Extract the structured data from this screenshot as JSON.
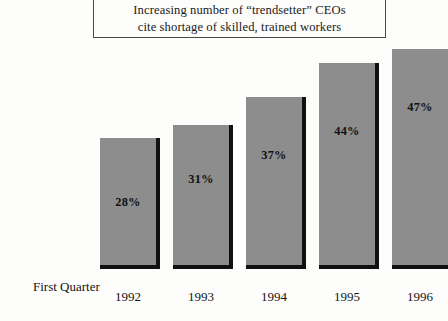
{
  "figure": {
    "background_color": "#fdfdfb",
    "width": 434,
    "height": 321
  },
  "title": {
    "line1": "Increasing number of “trendsetter” CEOs",
    "line2": "cite shortage of skilled, trained workers",
    "border_color": "#4a4a4a"
  },
  "axis_title": {
    "label": "First Quarter"
  },
  "style": {
    "bar_color": "#8d8d8d",
    "bar_shadow_color": "#111111",
    "label_color": "#111111"
  },
  "chart_data": {
    "type": "bar",
    "title": "Increasing number of “trendsetter” CEOs cite shortage of skilled, trained workers",
    "xlabel": "First Quarter",
    "ylabel": "",
    "categories": [
      "1992",
      "1993",
      "1994",
      "1995",
      "1996"
    ],
    "values": [
      28,
      31,
      37,
      44,
      47
    ],
    "value_labels": [
      "28%",
      "31%",
      "37%",
      "44%",
      "47%"
    ],
    "ylim": [
      0,
      54
    ],
    "grid": false,
    "legend": "none",
    "units": "percent"
  },
  "bars": [
    {
      "category": "1992",
      "value": 28,
      "value_label": "28%",
      "left": 100,
      "width": 56,
      "top": 138,
      "label_top": 195
    },
    {
      "category": "1993",
      "value": 31,
      "value_label": "31%",
      "left": 173,
      "width": 56,
      "top": 125,
      "label_top": 172
    },
    {
      "category": "1994",
      "value": 37,
      "value_label": "37%",
      "left": 246,
      "width": 56,
      "top": 97,
      "label_top": 148
    },
    {
      "category": "1995",
      "value": 44,
      "value_label": "44%",
      "left": 319,
      "width": 56,
      "top": 63,
      "label_top": 124
    },
    {
      "category": "1996",
      "value": 47,
      "value_label": "47%",
      "left": 358,
      "width": 56,
      "top": 49,
      "label_top": 100
    }
  ]
}
